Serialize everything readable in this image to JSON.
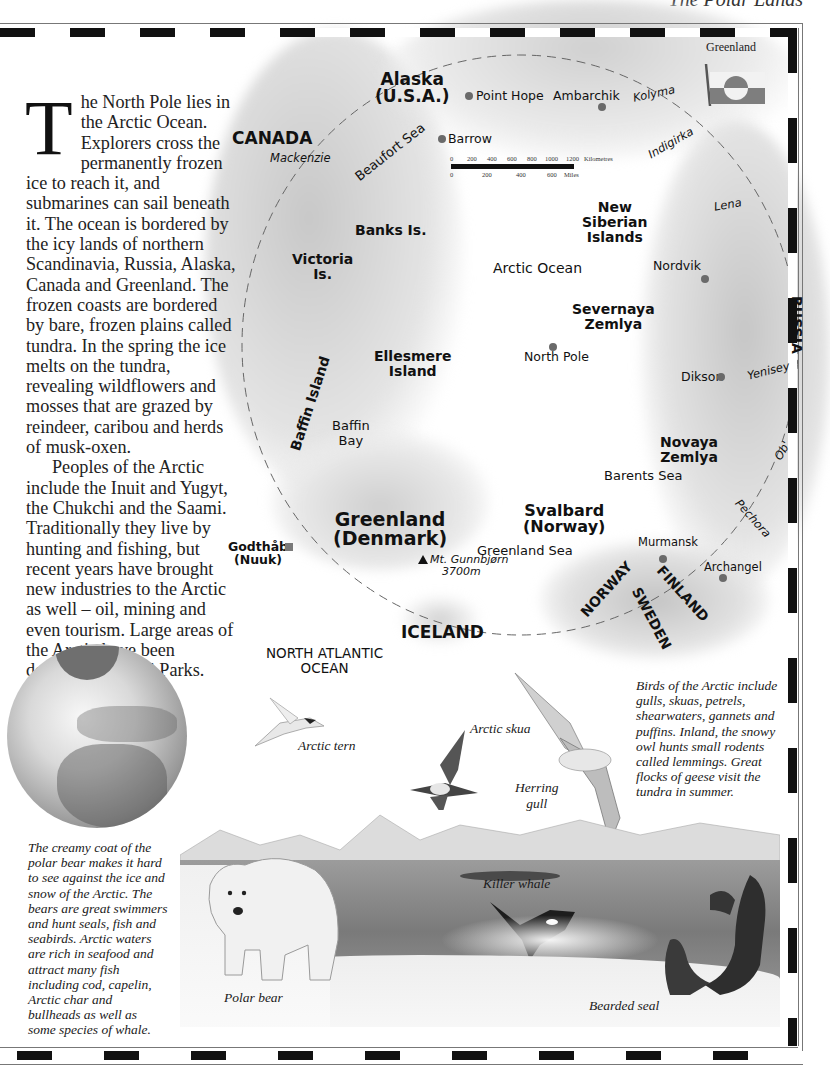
{
  "header": {
    "running_head": "The Polar Lands"
  },
  "intro": {
    "dropcap": "T",
    "paragraph1": "he North Pole lies in the Arctic Ocean. Explorers cross the permanently frozen ice to reach it, and submarines can sail beneath it. The ocean is bordered by the icy lands of northern Scandinavia, Russia, Alaska, Canada and Greenland. The frozen coasts are bordered by bare, frozen plains called tundra. In the spring the ice melts on the tundra, revealing wildflowers and mosses that are grazed by reindeer, caribou and herds of musk-oxen.",
    "paragraph2": "Peoples of the Arctic include the Inuit and Yugyt, the Chukchi and the Saami. Traditionally they live by hunting and fishing, but recent years have brought new industries to the Arctic as well – oil, mining and even tourism. Large areas of the Arctic have been declared National Parks."
  },
  "flag": {
    "label": "Greenland",
    "colors": {
      "red": "#8a8a8a",
      "white": "#f4f4f4"
    }
  },
  "map": {
    "countries": {
      "canada": "CANADA",
      "alaska": "Alaska",
      "alaska_sub": "(U.S.A.)",
      "russia": "RUSSIA",
      "greenland": "Greenland",
      "greenland_sub": "(Denmark)",
      "iceland": "ICELAND",
      "norway": "NORWAY",
      "finland": "FINLAND",
      "sweden": "SWEDEN",
      "svalbard": "Svalbard",
      "svalbard_sub": "(Norway)"
    },
    "islands": {
      "banks": "Banks Is.",
      "victoria_1": "Victoria",
      "victoria_2": "Is.",
      "ellesmere_1": "Ellesmere",
      "ellesmere_2": "Island",
      "baffin": "Baffin Island",
      "new_siberian_1": "New",
      "new_siberian_2": "Siberian",
      "new_siberian_3": "Islands",
      "severnaya_1": "Severnaya",
      "severnaya_2": "Zemlya",
      "novaya_1": "Novaya",
      "novaya_2": "Zemlya"
    },
    "seas": {
      "arctic_ocean": "Arctic Ocean",
      "beaufort": "Beaufort Sea",
      "baffin_bay_1": "Baffin",
      "baffin_bay_2": "Bay",
      "barents": "Barents Sea",
      "greenland_sea": "Greenland Sea",
      "north_atlantic_1": "NORTH ATLANTIC",
      "north_atlantic_2": "OCEAN"
    },
    "rivers": {
      "mackenzie": "Mackenzie",
      "kolyma": "Kolyma",
      "indigirka": "Indigirka",
      "lena": "Lena",
      "yenisey": "Yenisey",
      "ob": "Ob'",
      "pechora": "Pechora"
    },
    "places": {
      "point_hope": "Point Hope",
      "barrow": "Barrow",
      "ambarchik": "Ambarchik",
      "nordvik": "Nordvik",
      "north_pole": "North Pole",
      "dikson": "Dikson",
      "murmansk": "Murmansk",
      "archangel": "Archangel",
      "godthab_1": "Godthåb",
      "godthab_2": "(Nuuk)",
      "gunnbjorn": "Mt. Gunnbjørn",
      "gunnbjorn_height": "3700m"
    },
    "scale": {
      "km_ticks": [
        "0",
        "200",
        "400",
        "600",
        "800",
        "1000",
        "1200"
      ],
      "km_unit": "Kilometres",
      "mile_ticks": [
        "0",
        "200",
        "400",
        "600"
      ],
      "mile_unit": "Miles"
    }
  },
  "captions": {
    "birds": "Birds of the Arctic include gulls, skuas, petrels, shearwaters, gannets and puffins. Inland, the snowy owl hunts small rodents called lemmings. Great flocks of geese visit the tundra in summer.",
    "polar_bear": "The creamy coat of the polar bear makes it hard to see against the ice and snow of the Arctic. The bears are great swimmers and hunt seals, fish and seabirds. Arctic waters are rich in seafood and attract many fish including cod, capelin, Arctic char and bullheads as well as some species of whale."
  },
  "animals": {
    "arctic_tern": "Arctic tern",
    "arctic_skua": "Arctic skua",
    "herring_gull_1": "Herring",
    "herring_gull_2": "gull",
    "killer_whale": "Killer whale",
    "polar_bear": "Polar bear",
    "bearded_seal": "Bearded seal"
  }
}
